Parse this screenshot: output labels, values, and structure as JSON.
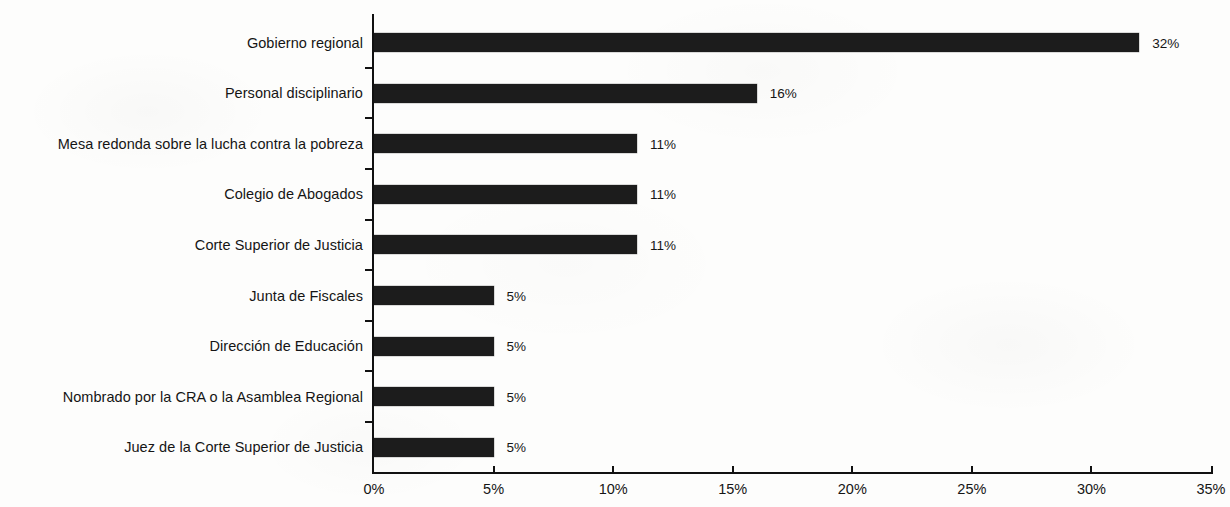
{
  "chart_data": {
    "type": "bar",
    "orientation": "horizontal",
    "title": "",
    "subtitle": "",
    "xlabel": "",
    "ylabel": "",
    "xlim": [
      0,
      35
    ],
    "xunit": "%",
    "grid": false,
    "legend": null,
    "bar_color": "#1c1c1c",
    "background_color": "#fdfdfc",
    "categories": [
      "Gobierno regional",
      "Personal disciplinario",
      "Mesa redonda sobre la lucha contra la pobreza",
      "Colegio de Abogados",
      "Corte Superior de Justicia",
      "Junta de Fiscales",
      "Dirección de Educación",
      "Nombrado por la CRA o la Asamblea Regional",
      "Juez de la Corte Superior de Justicia"
    ],
    "values": [
      32,
      16,
      11,
      11,
      11,
      5,
      5,
      5,
      5
    ],
    "data_labels": [
      "32%",
      "16%",
      "11%",
      "11%",
      "11%",
      "5%",
      "5%",
      "5%",
      "5%"
    ],
    "xticks": [
      0,
      5,
      10,
      15,
      20,
      25,
      30,
      35
    ],
    "xticklabels": [
      "0%",
      "5%",
      "10%",
      "15%",
      "20%",
      "25%",
      "30%",
      "35%"
    ]
  }
}
